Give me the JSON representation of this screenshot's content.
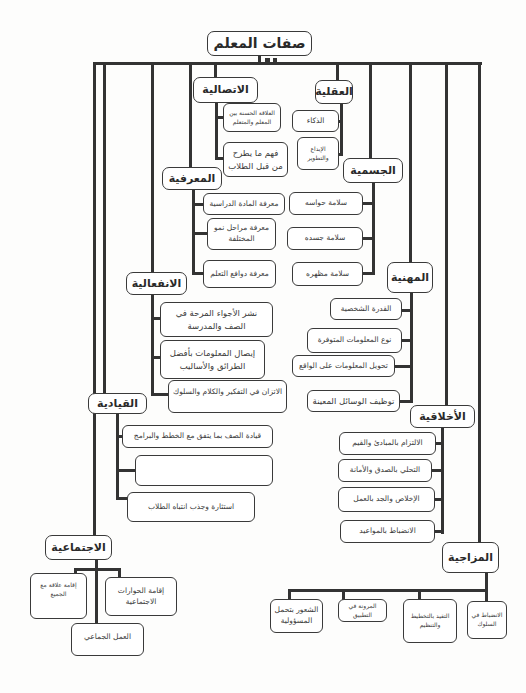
{
  "title": "صفات المعلم",
  "categories": {
    "communicative": {
      "label": "الاتصالية",
      "items": [
        "العلاقة الحسنة بين المعلم والمتعلم",
        "فهم ما يطرح من قبل الطلاب"
      ]
    },
    "mental": {
      "label": "العقلية",
      "items": [
        "الذكاء",
        "الإبداع والتطوير"
      ]
    },
    "cognitive": {
      "label": "المعرفية",
      "items": [
        "معرفة المادة الدراسية",
        "معرفة مراحل نمو المختلفة",
        "معرفة دوافع التعلم"
      ]
    },
    "physical": {
      "label": "الجسمية",
      "items": [
        "سلامة حواسه",
        "سلامة جسده",
        "سلامة مظهره"
      ]
    },
    "emotional": {
      "label": "الانفعالية",
      "items": [
        "نشر الأجواء المرحة في الصف والمدرسة",
        "إيصال المعلومات بأفضل الطرائق والأساليب",
        "الاتزان في التفكير والكلام والسلوك"
      ]
    },
    "professional": {
      "label": "المهنية",
      "items": [
        "القدرة الشخصية",
        "نوع المعلومات المتوفرة",
        "تحويل المعلومات على الواقع",
        "توظيف الوسائل المعينة"
      ]
    },
    "leadership": {
      "label": "القيادية",
      "items": [
        "قيادة الصف بما يتفق مع الخطط والبرامج",
        "",
        "استثارة وجذب انتباه الطلاب"
      ]
    },
    "ethical": {
      "label": "الأخلاقية",
      "items": [
        "الالتزام بالمبادئ والقيم",
        "التحلي بالصدق والأمانة",
        "الإخلاص والجد بالعمل",
        "الانضباط بالمواعيد"
      ]
    },
    "social": {
      "label": "الاجتماعية",
      "items": [
        "إقامة علاقة مع الجميع",
        "إقامة الحوارات الاجتماعية",
        "العمل الجماعي"
      ]
    },
    "temperamental": {
      "label": "المزاجية",
      "items": [
        "الشعور بتحمل المسؤولية",
        "المرونة في التطبيق",
        "التقيد بالتخطيط والتنظيم",
        "الانضباط في السلوك"
      ]
    }
  },
  "colors": {
    "line": "#333333",
    "border": "#3a3a3a",
    "background": "#fdfdfc"
  }
}
